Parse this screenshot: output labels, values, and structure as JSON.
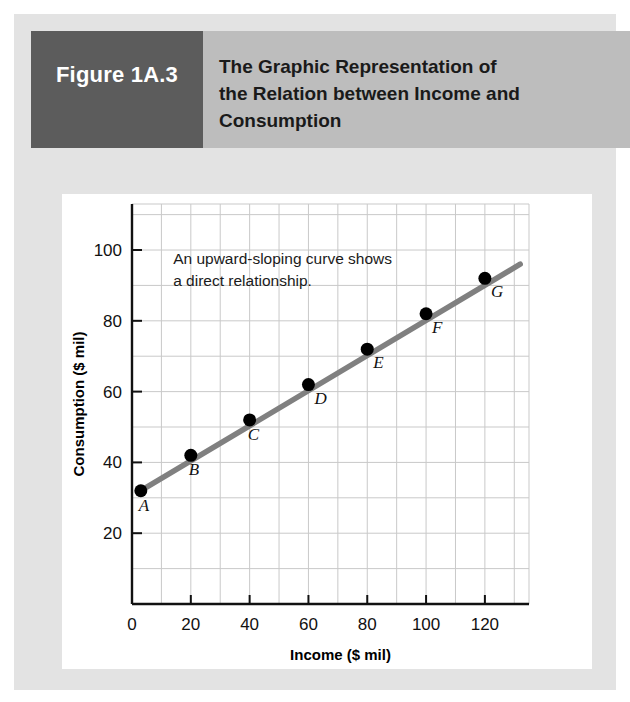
{
  "figure": {
    "tag": "Figure 1A.3",
    "title_lines": [
      "The Graphic Representation of",
      "the Relation between Income and",
      "Consumption"
    ],
    "tag_bg": "#5c5c5c",
    "header_bg": "#bdbdbd",
    "panel_bg": "#e3e3e3",
    "card_bg": "#ffffff"
  },
  "chart_data": {
    "type": "line",
    "title": "The Graphic Representation of the Relation between Income and Consumption",
    "xlabel": "Income ($ mil)",
    "ylabel": "Consumption ($ mil)",
    "xlim": [
      0,
      135
    ],
    "ylim": [
      0,
      113
    ],
    "xticks": [
      0,
      20,
      40,
      60,
      80,
      100,
      120
    ],
    "yticks": [
      20,
      40,
      60,
      80,
      100
    ],
    "xtick_labels": [
      "0",
      "20",
      "40",
      "60",
      "80",
      "100",
      "120"
    ],
    "ytick_labels": [
      "20",
      "40",
      "60",
      "80",
      "100"
    ],
    "grid": true,
    "grid_step_x": 10,
    "grid_step_y": 10,
    "legend": "none",
    "line_color": "#808080",
    "marker_color": "#000000",
    "annotation": {
      "lines": [
        "An upward-sloping curve shows",
        "a direct relationship."
      ],
      "x": 14,
      "y": 96
    },
    "points": [
      {
        "label": "A",
        "x": 3,
        "y": 32,
        "label_dx": -2,
        "label_dy": -20
      },
      {
        "label": "B",
        "x": 20,
        "y": 42,
        "label_dx": -2,
        "label_dy": -20
      },
      {
        "label": "C",
        "x": 40,
        "y": 52,
        "label_dx": -2,
        "label_dy": -20
      },
      {
        "label": "D",
        "x": 60,
        "y": 62,
        "label_dx": 6,
        "label_dy": -19
      },
      {
        "label": "E",
        "x": 80,
        "y": 72,
        "label_dx": 6,
        "label_dy": -19
      },
      {
        "label": "F",
        "x": 100,
        "y": 82,
        "label_dx": 6,
        "label_dy": -19
      },
      {
        "label": "G",
        "x": 120,
        "y": 92,
        "label_dx": 6,
        "label_dy": -19
      }
    ],
    "series": [
      {
        "name": "Consumption function",
        "x": [
          3,
          20,
          40,
          60,
          80,
          100,
          120
        ],
        "values": [
          32,
          42,
          52,
          62,
          72,
          82,
          92
        ]
      }
    ],
    "line_extent": {
      "x0": 3,
      "y0": 32,
      "x1": 132,
      "y1": 96
    }
  }
}
